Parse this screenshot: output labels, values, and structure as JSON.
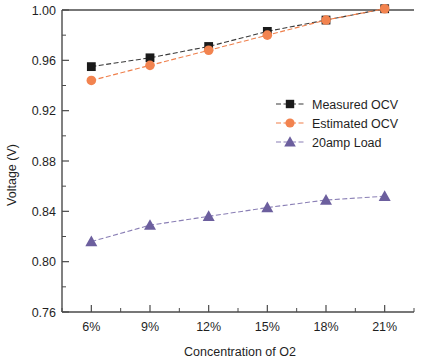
{
  "chart_data": {
    "type": "line",
    "title": "",
    "xlabel": "Concentration of O2",
    "ylabel": "Voltage (V)",
    "categories": [
      "6%",
      "9%",
      "12%",
      "15%",
      "18%",
      "21%"
    ],
    "x": [
      6,
      9,
      12,
      15,
      18,
      21
    ],
    "ylim": [
      0.76,
      1.0
    ],
    "yticks": [
      "0.76",
      "0.80",
      "0.84",
      "0.88",
      "0.92",
      "0.96",
      "1.00"
    ],
    "ytick_values": [
      0.76,
      0.8,
      0.84,
      0.88,
      0.92,
      0.96,
      1.0
    ],
    "xticks": [
      "6%",
      "9%",
      "12%",
      "15%",
      "18%",
      "21%"
    ],
    "grid": false,
    "legend_position": "center-right",
    "minor_ticks": true,
    "series": [
      {
        "name": "Measured OCV",
        "marker": "square",
        "color": "#1a1a1a",
        "line_color": "#3a3a3a",
        "values": [
          0.955,
          0.962,
          0.971,
          0.983,
          0.992,
          1.001
        ]
      },
      {
        "name": "Estimated OCV",
        "marker": "circle",
        "color": "#f2834f",
        "line_color": "#ef7f4b",
        "values": [
          0.944,
          0.956,
          0.968,
          0.98,
          0.992,
          1.001
        ]
      },
      {
        "name": "20amp Load",
        "marker": "triangle",
        "color": "#6c5f9e",
        "line_color": "#8a7fb5",
        "values": [
          0.816,
          0.829,
          0.836,
          0.843,
          0.849,
          0.852
        ]
      }
    ]
  },
  "legend": {
    "items": [
      {
        "label": "Measured OCV"
      },
      {
        "label": "Estimated OCV"
      },
      {
        "label": "20amp Load"
      }
    ]
  },
  "axes": {
    "x_title": "Concentration of O2",
    "y_title": "Voltage (V)"
  }
}
